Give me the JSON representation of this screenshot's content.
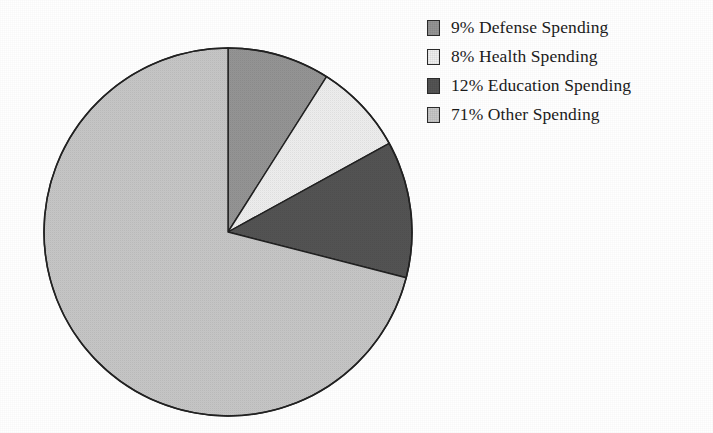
{
  "chart_data": {
    "type": "pie",
    "title": "",
    "subtitle": "",
    "xlabel": "",
    "ylabel": "",
    "grid": false,
    "legend_position": "right",
    "start_angle_deg": 0,
    "direction": "clockwise",
    "unit": "%",
    "categories": [
      "Defense Spending",
      "Health Spending",
      "Education Spending",
      "Other Spending"
    ],
    "values": [
      9,
      8,
      12,
      71
    ],
    "colors": [
      "#969696",
      "#f0f0f0",
      "#555555",
      "#c8c8c8"
    ],
    "slices": [
      {
        "label": "Defense Spending",
        "value": 9,
        "display": "9%",
        "legend_text": "9% Defense Spending",
        "color": "#969696"
      },
      {
        "label": "Health Spending",
        "value": 8,
        "display": "8%",
        "legend_text": "8% Health Spending",
        "color": "#f0f0f0"
      },
      {
        "label": "Education Spending",
        "value": 12,
        "display": "12%",
        "legend_text": "12% Education Spending",
        "color": "#555555"
      },
      {
        "label": "Other Spending",
        "value": 71,
        "display": "71%",
        "legend_text": "71% Other Spending",
        "color": "#c8c8c8"
      }
    ]
  },
  "legend": {
    "rows": [
      {
        "text": "9% Defense Spending",
        "color": "#969696"
      },
      {
        "text": "8% Health Spending",
        "color": "#f0f0f0"
      },
      {
        "text": "12% Education Spending",
        "color": "#555555"
      },
      {
        "text": "71% Other Spending",
        "color": "#c8c8c8"
      }
    ]
  },
  "style": {
    "background": "#ffffff",
    "outline": "#222222"
  }
}
